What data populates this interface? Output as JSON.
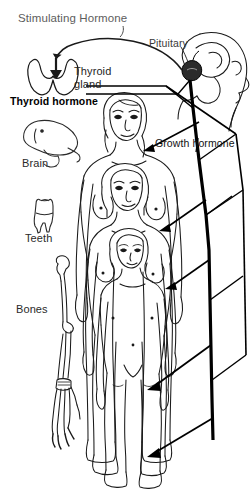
{
  "diagram": {
    "canvas": {
      "width": 251,
      "height": 498
    },
    "colors": {
      "background": "#ffffff",
      "ink": "#000000",
      "gray_text": "#5d5d5d",
      "dark_text": "#111111",
      "pituitary_fill": "#2b2b2b"
    }
  },
  "labels": {
    "stimulating_hormone": "Stimulating Hormone",
    "pituitary": "Pituitary",
    "thyroid_gland_line1": "Thyroid",
    "thyroid_gland_line2": "gland",
    "thyroid_hormone": "Thyroid hormone",
    "growth_hormone": "Growth hormone",
    "brain": "Brain",
    "teeth": "Teeth",
    "bones": "Bones"
  },
  "organs": [
    {
      "name": "thyroid-gland",
      "label": "Thyroid gland"
    },
    {
      "name": "brain",
      "label": "Brain"
    },
    {
      "name": "teeth",
      "label": "Teeth"
    },
    {
      "name": "bones",
      "label": "Bones"
    },
    {
      "name": "pituitary",
      "label": "Pituitary"
    }
  ],
  "figures": [
    {
      "name": "figure-adolescent",
      "stage": "largest"
    },
    {
      "name": "figure-child",
      "stage": "middle"
    },
    {
      "name": "figure-young-child",
      "stage": "smallest"
    }
  ],
  "arrows": [
    {
      "name": "stimulating-hormone-arrow",
      "from": "pituitary",
      "to": "thyroid-gland"
    },
    {
      "name": "growth-hormone-arrow-1",
      "from": "pituitary",
      "to": "figure-adolescent"
    },
    {
      "name": "growth-hormone-arrow-2",
      "from": "pituitary",
      "to": "figure-child-torso"
    },
    {
      "name": "growth-hormone-arrow-3",
      "from": "pituitary",
      "to": "figure-child-legs"
    },
    {
      "name": "growth-hormone-arrow-4",
      "from": "pituitary",
      "to": "figure-feet"
    }
  ]
}
